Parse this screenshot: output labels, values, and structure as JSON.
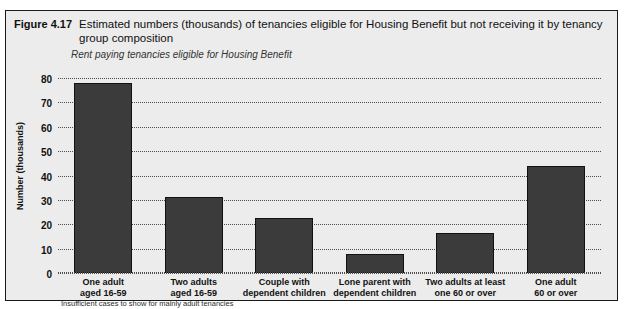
{
  "figure": {
    "number": "Figure 4.17",
    "title": "Estimated numbers (thousands) of tenancies eligible for Housing Benefit but not receiving it by tenancy group composition",
    "subtitle": "Rent paying tenancies eligible for Housing Benefit",
    "footnote": "Insufficient cases to show for mainly adult tenancies"
  },
  "colors": {
    "bar_fill": "#3b3b3b",
    "bar_stroke": "#111111",
    "panel_background": "#ececec",
    "gridline": "#4d4d4d",
    "text": "#111111"
  },
  "chart_data": {
    "type": "bar",
    "title": "Estimated numbers (thousands) of tenancies eligible for Housing Benefit but not receiving it by tenancy group composition",
    "subtitle": "Rent paying tenancies eligible for Housing Benefit",
    "xlabel": "",
    "ylabel": "Number (thousands)",
    "ylim": [
      0,
      80
    ],
    "yticks": [
      0,
      10,
      20,
      30,
      40,
      50,
      60,
      70,
      80
    ],
    "ytick_labels": [
      "0",
      "10",
      "20",
      "30",
      "40",
      "50",
      "60",
      "70",
      "80"
    ],
    "grid": true,
    "legend": false,
    "categories": [
      "One adult aged 16-59",
      "Two adults aged 16-59",
      "Couple with dependent children",
      "Lone parent with dependent children",
      "Two adults at least one 60 or over",
      "One adult 60 or over"
    ],
    "category_lines": [
      [
        "One adult",
        "aged 16-59"
      ],
      [
        "Two adults",
        "aged 16-59"
      ],
      [
        "Couple with",
        "dependent children"
      ],
      [
        "Lone parent with",
        "dependent children"
      ],
      [
        "Two adults at least",
        "one 60 or over"
      ],
      [
        "One adult",
        "60 or over"
      ]
    ],
    "values": [
      78,
      31,
      22.5,
      8,
      16.5,
      44
    ],
    "annotations": [
      "Insufficient cases to show for mainly adult tenancies"
    ]
  }
}
